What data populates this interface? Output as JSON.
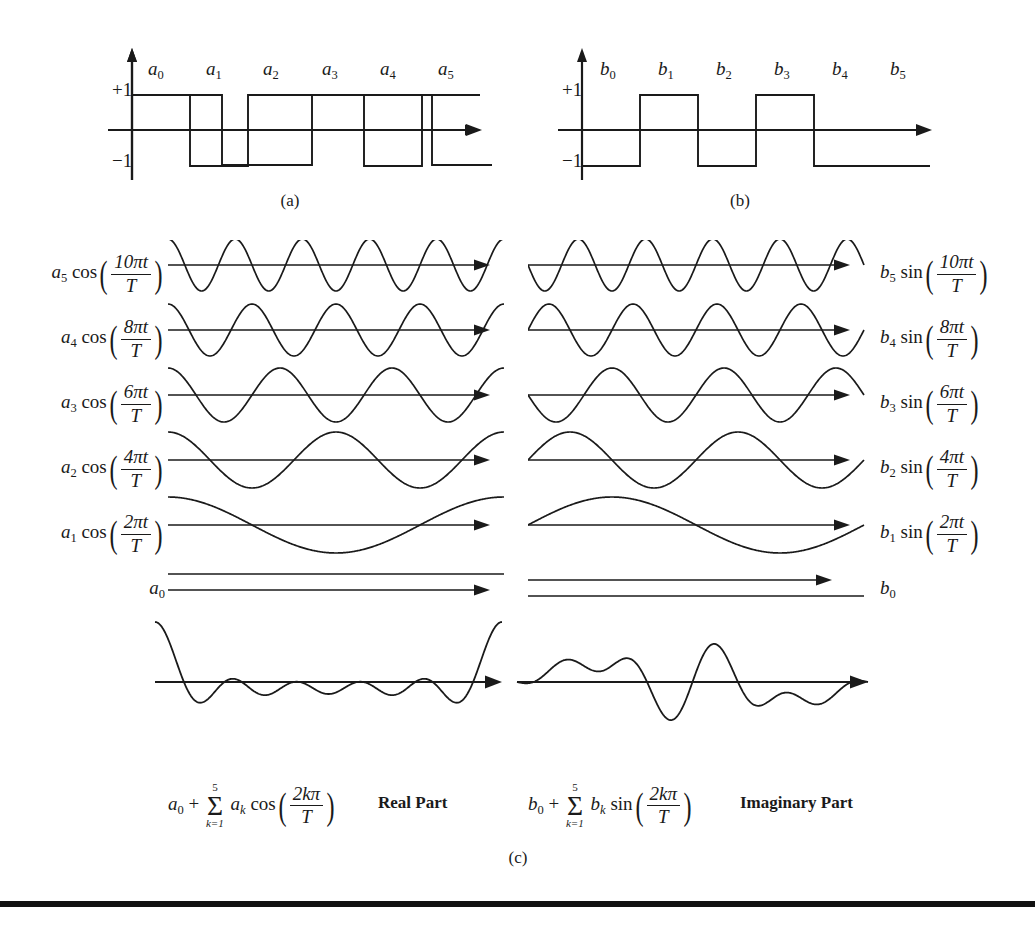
{
  "figure": {
    "captions": {
      "a": "(a)",
      "b": "(b)",
      "c": "(c)"
    },
    "stroke_color": "#1a1a1a",
    "background_color": "#ffffff"
  },
  "panel_a": {
    "caption": "(a)",
    "axis_labels": {
      "plus_one": "+1",
      "minus_one": "−1"
    },
    "coefficient_labels": [
      "a₀",
      "a₁",
      "a₂",
      "a₃",
      "a₄",
      "a₅"
    ],
    "coefficient_bases": [
      "a",
      "a",
      "a",
      "a",
      "a",
      "a"
    ],
    "coefficient_subs": [
      "0",
      "1",
      "2",
      "3",
      "4",
      "5"
    ],
    "values": [
      1,
      -1,
      1,
      1,
      -1,
      1
    ]
  },
  "panel_b": {
    "caption": "(b)",
    "axis_labels": {
      "plus_one": "+1",
      "minus_one": "−1"
    },
    "coefficient_labels": [
      "b₀",
      "b₁",
      "b₂",
      "b₃",
      "b₄",
      "b₅"
    ],
    "coefficient_bases": [
      "b",
      "b",
      "b",
      "b",
      "b",
      "b"
    ],
    "coefficient_subs": [
      "0",
      "1",
      "2",
      "3",
      "4",
      "5"
    ],
    "values": [
      -1,
      1,
      -1,
      1,
      -1,
      -1
    ]
  },
  "panel_c": {
    "caption": "(c)",
    "left_column": {
      "part_label": "Real Part",
      "sum_formula_text": "a₀ + Σ(k=1..5) aₖ cos(2kπ/T)",
      "sum": {
        "lead_base": "a",
        "lead_sub": "0",
        "plus": "+",
        "sigma": "Σ",
        "lim_top": "5",
        "lim_bot": "k=1",
        "term_base": "a",
        "term_sub": "k",
        "fn": "cos",
        "num": "2kπ",
        "den": "T"
      },
      "rows": [
        {
          "base": "a",
          "sub": "5",
          "fn": "cos",
          "num": "10πt",
          "den": "T",
          "harmonic": 5,
          "phase": "cos",
          "amplitude": 0.85
        },
        {
          "base": "a",
          "sub": "4",
          "fn": "cos",
          "num": "8πt",
          "den": "T",
          "harmonic": 4,
          "phase": "cos",
          "amplitude": 0.9
        },
        {
          "base": "a",
          "sub": "3",
          "fn": "cos",
          "num": "6πt",
          "den": "T",
          "harmonic": 3,
          "phase": "cos",
          "amplitude": 0.95
        },
        {
          "base": "a",
          "sub": "2",
          "fn": "cos",
          "num": "4πt",
          "den": "T",
          "harmonic": 2,
          "phase": "cos",
          "amplitude": 1.0
        },
        {
          "base": "a",
          "sub": "1",
          "fn": "cos",
          "num": "2πt",
          "den": "T",
          "harmonic": 1,
          "phase": "cos",
          "amplitude": 1.0
        },
        {
          "base": "a",
          "sub": "0",
          "fn": "",
          "num": "",
          "den": "",
          "harmonic": 0,
          "phase": "dc",
          "amplitude": 0.0
        }
      ],
      "composite_name": "real-part-composite-waveform"
    },
    "right_column": {
      "part_label": "Imaginary Part",
      "sum_formula_text": "b₀ + Σ(k=1..5) bₖ sin(2kπ/T)",
      "sum": {
        "lead_base": "b",
        "lead_sub": "0",
        "plus": "+",
        "sigma": "Σ",
        "lim_top": "5",
        "lim_bot": "k=1",
        "term_base": "b",
        "term_sub": "k",
        "fn": "sin",
        "num": "2kπ",
        "den": "T"
      },
      "rows": [
        {
          "base": "b",
          "sub": "5",
          "fn": "sin",
          "num": "10πt",
          "den": "T",
          "harmonic": 5,
          "phase": "sin-neg",
          "amplitude": 0.85
        },
        {
          "base": "b",
          "sub": "4",
          "fn": "sin",
          "num": "8πt",
          "den": "T",
          "harmonic": 4,
          "phase": "sin",
          "amplitude": 0.9
        },
        {
          "base": "b",
          "sub": "3",
          "fn": "sin",
          "num": "6πt",
          "den": "T",
          "harmonic": 3,
          "phase": "sin-neg",
          "amplitude": 0.95
        },
        {
          "base": "b",
          "sub": "2",
          "fn": "sin",
          "num": "4πt",
          "den": "T",
          "harmonic": 2,
          "phase": "sin",
          "amplitude": 1.0
        },
        {
          "base": "b",
          "sub": "1",
          "fn": "sin",
          "num": "2πt",
          "den": "T",
          "harmonic": 1,
          "phase": "sin",
          "amplitude": 1.0
        },
        {
          "base": "b",
          "sub": "0",
          "fn": "",
          "num": "",
          "den": "",
          "harmonic": 0,
          "phase": "dc-neg",
          "amplitude": 0.0
        }
      ],
      "composite_name": "imaginary-part-composite-waveform"
    }
  },
  "chart_data": {
    "type": "line",
    "xlabel": "",
    "ylabel": "",
    "panels": [
      {
        "id": "a",
        "caption": "(a)",
        "type": "bar",
        "description": "Square wave of cosine coefficients a0..a5",
        "categories": [
          "a0",
          "a1",
          "a2",
          "a3",
          "a4",
          "a5"
        ],
        "values": [
          1,
          -1,
          1,
          1,
          -1,
          1
        ],
        "ylim": [
          -1,
          1
        ],
        "ytick_labels": [
          "+1",
          "−1"
        ],
        "grid": false
      },
      {
        "id": "b",
        "caption": "(b)",
        "type": "bar",
        "description": "Square wave of sine coefficients b0..b5",
        "categories": [
          "b0",
          "b1",
          "b2",
          "b3",
          "b4",
          "b5"
        ],
        "values": [
          -1,
          1,
          -1,
          1,
          -1,
          -1
        ],
        "ylim": [
          -1,
          1
        ],
        "ytick_labels": [
          "+1",
          "−1"
        ],
        "grid": false
      },
      {
        "id": "c",
        "caption": "(c)",
        "type": "line",
        "description": "Harmonic component waveforms and their summed composites",
        "series": [
          {
            "name": "a5 cos(10πt/T)",
            "harmonic": 5,
            "phase": "cos",
            "column": "left"
          },
          {
            "name": "a4 cos(8πt/T)",
            "harmonic": 4,
            "phase": "cos",
            "column": "left"
          },
          {
            "name": "a3 cos(6πt/T)",
            "harmonic": 3,
            "phase": "cos",
            "column": "left"
          },
          {
            "name": "a2 cos(4πt/T)",
            "harmonic": 2,
            "phase": "cos",
            "column": "left"
          },
          {
            "name": "a1 cos(2πt/T)",
            "harmonic": 1,
            "phase": "cos",
            "column": "left"
          },
          {
            "name": "a0",
            "harmonic": 0,
            "phase": "dc",
            "column": "left"
          },
          {
            "name": "b5 sin(10πt/T)",
            "harmonic": 5,
            "phase": "sin-neg",
            "column": "right"
          },
          {
            "name": "b4 sin(8πt/T)",
            "harmonic": 4,
            "phase": "sin",
            "column": "right"
          },
          {
            "name": "b3 sin(6πt/T)",
            "harmonic": 3,
            "phase": "sin-neg",
            "column": "right"
          },
          {
            "name": "b2 sin(4πt/T)",
            "harmonic": 2,
            "phase": "sin",
            "column": "right"
          },
          {
            "name": "b1 sin(2πt/T)",
            "harmonic": 1,
            "phase": "sin",
            "column": "right"
          },
          {
            "name": "b0",
            "harmonic": 0,
            "phase": "dc-neg",
            "column": "right"
          }
        ],
        "annotations": [
          "Real Part",
          "Imaginary Part"
        ],
        "legend": "none",
        "grid": false
      }
    ]
  }
}
